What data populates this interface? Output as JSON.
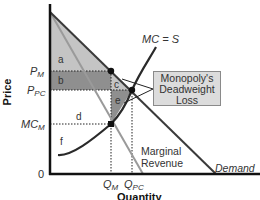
{
  "diagram": {
    "axes": {
      "x_label": "Quantity",
      "y_label": "Price",
      "origin_label": "0"
    },
    "y_ticks": [
      {
        "label": "P",
        "sub": "M",
        "name": "price-monopoly"
      },
      {
        "label": "P",
        "sub": "PC",
        "name": "price-perfect-competition"
      },
      {
        "label": "MC",
        "sub": "M",
        "name": "marginal-cost-monopoly"
      }
    ],
    "x_ticks": [
      {
        "label": "Q",
        "sub": "M",
        "name": "quantity-monopoly"
      },
      {
        "label": "Q",
        "sub": "PC",
        "name": "quantity-perfect-competition"
      }
    ],
    "curves": {
      "mc": "MC = S",
      "demand": "Demand",
      "mr_line1": "Marginal",
      "mr_line2": "Revenue"
    },
    "regions": [
      "a",
      "b",
      "c",
      "d",
      "e",
      "f"
    ],
    "annotation": {
      "line1": "Monopoly's",
      "line2": "Deadweight",
      "line3": "Loss"
    },
    "colors": {
      "light_fill": "#c4c4c4",
      "dark_fill": "#8f8f8f",
      "demand_line": "#3a3a3a",
      "mr_line": "#9a9a9a",
      "mc_line": "#2a2a2a",
      "box_fill": "#dcdcdc"
    }
  }
}
